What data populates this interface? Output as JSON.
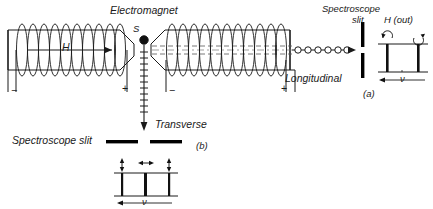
{
  "figure": {
    "title_label": "Electromagnet",
    "source_label": "S",
    "field_label": "H",
    "longitudinal_label": "Longitudinal",
    "transverse_label": "Transverse",
    "slit_label_top": "Spectroscope",
    "slit_label_top2": "slit",
    "slit_label_bottom": "Spectroscope slit",
    "inset_a": {
      "tag": "(a)",
      "header": "H (out)",
      "axis_label": "ν",
      "lines": 2,
      "arc_icons": [
        "circular-arrow-ccw",
        "circular-arrow-cw"
      ]
    },
    "inset_b": {
      "tag": "(b)",
      "axis_label": "ν",
      "lines": 3,
      "polarization_arrows": [
        "vertical",
        "horizontal",
        "vertical"
      ]
    },
    "terminals": {
      "left_minus": "−",
      "left_plus": "+",
      "right_minus": "−",
      "right_plus": "+"
    },
    "caption": "",
    "colors": {
      "ink": "#1a1a1a",
      "background": "#ffffff",
      "slit": "#000000"
    }
  }
}
